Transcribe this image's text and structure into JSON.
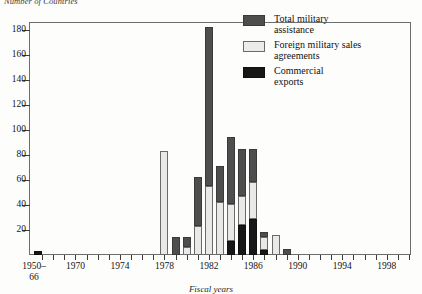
{
  "title": "Number of Countries",
  "legend": {
    "position": "top-right",
    "items": [
      {
        "key": "total_military_assistance",
        "label": "Total military\nassistance",
        "color": "#4e4e4e",
        "swatch": "tma"
      },
      {
        "key": "foreign_military_sales_agreements",
        "label": "Foreign military sales\nagreements",
        "color": "#ececea",
        "swatch": "fms"
      },
      {
        "key": "commercial_exports",
        "label": "Commercial\nexports",
        "color": "#171717",
        "swatch": "com"
      }
    ]
  },
  "axis_title_x": "Fiscal years",
  "chart_data": {
    "type": "bar",
    "stacked": true,
    "title": "Number of Countries",
    "xlabel": "Fiscal years",
    "ylabel": "",
    "ylim": [
      0,
      186
    ],
    "yticks": [
      20,
      40,
      60,
      80,
      100,
      120,
      140,
      160,
      180
    ],
    "xlim": [
      1966,
      2000
    ],
    "xticks": [
      "1950–66",
      "1970",
      "1974",
      "1978",
      "1982",
      "1986",
      "1990",
      "1994",
      "1998"
    ],
    "grid": false,
    "legend_position": "top-right",
    "stack_order_bottom_to_top": [
      "commercial_exports",
      "foreign_military_sales_agreements",
      "total_military_assistance"
    ],
    "categories": [
      "1950–66",
      "1967",
      "1968",
      "1969",
      "1970",
      "1971",
      "1972",
      "1973",
      "1974",
      "1975",
      "1976",
      "1977",
      "1978",
      "1979",
      "1980",
      "1981",
      "1982",
      "1983",
      "1984",
      "1985",
      "1986",
      "1987",
      "1988",
      "1989",
      "1990",
      "1991",
      "1992",
      "1993",
      "1994",
      "1995",
      "1996",
      "1997",
      "1998",
      "1999",
      "2000"
    ],
    "series": [
      {
        "name": "Commercial exports",
        "color": "#171717",
        "values": [
          3,
          0,
          0,
          0,
          0,
          0,
          0,
          0,
          0,
          0,
          0,
          0,
          0,
          0,
          0,
          0,
          0,
          0,
          11,
          24,
          29,
          4,
          0,
          0,
          0,
          0,
          0,
          0,
          0,
          0,
          0,
          0,
          0,
          0,
          0
        ]
      },
      {
        "name": "Foreign military sales agreements",
        "color": "#ececea",
        "values": [
          0,
          0,
          0,
          0,
          0,
          0,
          0,
          0,
          0,
          0,
          0,
          0,
          83,
          0,
          6,
          23,
          55,
          42,
          30,
          23,
          29,
          10,
          16,
          0,
          0,
          0,
          0,
          0,
          0,
          0,
          0,
          0,
          0,
          0,
          0
        ]
      },
      {
        "name": "Total military assistance",
        "color": "#4e4e4e",
        "values": [
          0,
          0,
          0,
          0,
          0,
          0,
          0,
          0,
          0,
          0,
          0,
          0,
          0,
          14,
          8,
          39,
          127,
          29,
          53,
          38,
          27,
          4,
          0,
          5,
          0,
          0,
          0,
          0,
          0,
          0,
          0,
          0,
          0,
          0,
          0
        ]
      }
    ],
    "stack_totals": [
      3,
      0,
      0,
      0,
      0,
      0,
      0,
      0,
      0,
      0,
      0,
      0,
      83,
      14,
      14,
      62,
      182,
      71,
      94,
      85,
      85,
      18,
      16,
      5,
      0,
      0,
      0,
      0,
      0,
      0,
      0,
      0,
      0,
      0,
      0
    ]
  }
}
